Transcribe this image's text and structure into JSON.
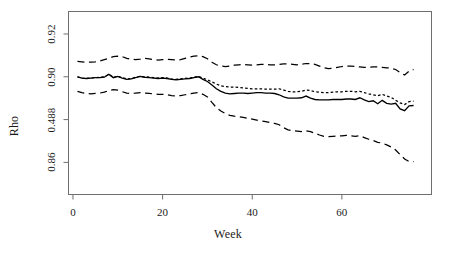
{
  "chart_data": {
    "type": "line",
    "title": "",
    "xlabel": "Week",
    "ylabel": "Rho",
    "xlim": [
      -1,
      80
    ],
    "ylim": [
      0.845,
      0.9305
    ],
    "grid": false,
    "legend": "none",
    "xticks": [
      0,
      20,
      40,
      60
    ],
    "xtick_labels": [
      "0",
      "20",
      "40",
      "60"
    ],
    "yticks": [
      0.92,
      0.9,
      0.88,
      0.86
    ],
    "ytick_labels": [
      "0.92",
      "0.90",
      "0.488",
      "0.86"
    ],
    "x": [
      1,
      2,
      3,
      4,
      5,
      6,
      7,
      8,
      9,
      10,
      11,
      12,
      13,
      14,
      15,
      16,
      17,
      18,
      19,
      20,
      21,
      22,
      23,
      24,
      25,
      26,
      27,
      28,
      29,
      30,
      31,
      32,
      33,
      34,
      35,
      36,
      37,
      38,
      39,
      40,
      41,
      42,
      43,
      44,
      45,
      46,
      47,
      48,
      49,
      50,
      51,
      52,
      53,
      54,
      55,
      56,
      57,
      58,
      59,
      60,
      61,
      62,
      63,
      64,
      65,
      66,
      67,
      68,
      69,
      70,
      71,
      72,
      73,
      74,
      75,
      76
    ],
    "series": [
      {
        "name": "upper-confidence-band",
        "style": "dashed",
        "values": [
          0.9072,
          0.907,
          0.9068,
          0.9068,
          0.907,
          0.9074,
          0.908,
          0.9086,
          0.9094,
          0.9096,
          0.9094,
          0.9086,
          0.9082,
          0.908,
          0.9082,
          0.9086,
          0.9084,
          0.908,
          0.9078,
          0.908,
          0.9082,
          0.908,
          0.9078,
          0.908,
          0.9086,
          0.9092,
          0.9096,
          0.9098,
          0.9094,
          0.9084,
          0.9068,
          0.9056,
          0.905,
          0.9048,
          0.905,
          0.9054,
          0.9056,
          0.9058,
          0.9056,
          0.9054,
          0.9056,
          0.9058,
          0.9058,
          0.9056,
          0.9056,
          0.9058,
          0.906,
          0.906,
          0.9058,
          0.9056,
          0.9058,
          0.9062,
          0.9062,
          0.9058,
          0.905,
          0.9042,
          0.9038,
          0.904,
          0.9044,
          0.9048,
          0.905,
          0.905,
          0.9048,
          0.9046,
          0.9044,
          0.9044,
          0.9046,
          0.9046,
          0.9044,
          0.9042,
          0.904,
          0.9034,
          0.902,
          0.9008,
          0.9026,
          0.9034
        ]
      },
      {
        "name": "dotted-estimate-series",
        "style": "dotted",
        "values": [
          0.9,
          0.8994,
          0.8992,
          0.8994,
          0.8996,
          0.8998,
          0.9,
          0.9012,
          0.8998,
          0.9002,
          0.8996,
          0.899,
          0.8992,
          0.8998,
          0.9002,
          0.9,
          0.8998,
          0.8996,
          0.8994,
          0.8996,
          0.8994,
          0.899,
          0.8988,
          0.899,
          0.8992,
          0.8994,
          0.8998,
          0.9002,
          0.8994,
          0.8986,
          0.8976,
          0.8966,
          0.8958,
          0.8954,
          0.8952,
          0.8952,
          0.895,
          0.8948,
          0.8946,
          0.8944,
          0.8944,
          0.8944,
          0.8942,
          0.8942,
          0.8942,
          0.8944,
          0.8938,
          0.8932,
          0.893,
          0.893,
          0.8932,
          0.8938,
          0.8936,
          0.893,
          0.8928,
          0.8926,
          0.8926,
          0.8928,
          0.893,
          0.893,
          0.8932,
          0.8932,
          0.893,
          0.8932,
          0.8926,
          0.892,
          0.8916,
          0.8912,
          0.8918,
          0.891,
          0.8904,
          0.889,
          0.8878,
          0.887,
          0.8884,
          0.8886
        ]
      },
      {
        "name": "solid-estimate-series",
        "style": "solid",
        "values": [
          0.9,
          0.8994,
          0.8992,
          0.8994,
          0.8996,
          0.8996,
          0.8998,
          0.9012,
          0.8996,
          0.9002,
          0.8994,
          0.8988,
          0.899,
          0.8996,
          0.9002,
          0.8998,
          0.8996,
          0.8994,
          0.8992,
          0.8994,
          0.8992,
          0.8988,
          0.8986,
          0.8988,
          0.899,
          0.8992,
          0.8996,
          0.9,
          0.8988,
          0.8978,
          0.8962,
          0.8944,
          0.8932,
          0.8924,
          0.892,
          0.8922,
          0.8924,
          0.8924,
          0.8922,
          0.8924,
          0.8926,
          0.8926,
          0.8924,
          0.8924,
          0.8922,
          0.8916,
          0.8906,
          0.89,
          0.89,
          0.89,
          0.8902,
          0.891,
          0.89,
          0.8894,
          0.8892,
          0.8892,
          0.8892,
          0.8894,
          0.8894,
          0.8894,
          0.8896,
          0.8896,
          0.8894,
          0.8902,
          0.8892,
          0.8884,
          0.8888,
          0.8874,
          0.889,
          0.8876,
          0.8872,
          0.8876,
          0.885,
          0.8842,
          0.8864,
          0.8866
        ]
      },
      {
        "name": "lower-confidence-band",
        "style": "dashed",
        "values": [
          0.8932,
          0.8926,
          0.8922,
          0.892,
          0.8922,
          0.8924,
          0.8928,
          0.8936,
          0.894,
          0.8938,
          0.893,
          0.8924,
          0.8922,
          0.8924,
          0.8926,
          0.8924,
          0.8922,
          0.892,
          0.8918,
          0.8918,
          0.8916,
          0.8912,
          0.891,
          0.8912,
          0.8916,
          0.892,
          0.8924,
          0.8926,
          0.8918,
          0.8906,
          0.888,
          0.8856,
          0.884,
          0.8828,
          0.882,
          0.8816,
          0.8814,
          0.881,
          0.8806,
          0.8802,
          0.8798,
          0.8794,
          0.879,
          0.8786,
          0.8782,
          0.8776,
          0.8762,
          0.8752,
          0.8748,
          0.8746,
          0.8744,
          0.8748,
          0.8744,
          0.8736,
          0.8728,
          0.8722,
          0.872,
          0.8722,
          0.8724,
          0.8724,
          0.8726,
          0.8724,
          0.8722,
          0.8724,
          0.8716,
          0.8708,
          0.8702,
          0.8694,
          0.869,
          0.8682,
          0.8672,
          0.8658,
          0.8636,
          0.8616,
          0.8604,
          0.8604
        ]
      }
    ]
  }
}
